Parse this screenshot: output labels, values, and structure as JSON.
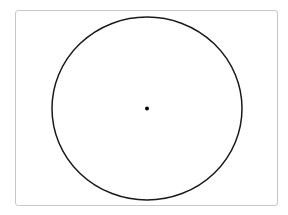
{
  "diagram": {
    "type": "circle-with-center-point",
    "frame": {
      "x": 15,
      "y": 10,
      "width": 263,
      "height": 196,
      "border_color": "#c8c8c8",
      "background": "#ffffff"
    },
    "circle": {
      "cx": 147,
      "cy": 108.5,
      "rx": 95,
      "ry": 91.5,
      "stroke": "#1a1a1a",
      "stroke_width": 1.5,
      "fill": "none"
    },
    "center_point": {
      "cx": 147,
      "cy": 108.5,
      "r": 2,
      "fill": "#000000"
    }
  }
}
